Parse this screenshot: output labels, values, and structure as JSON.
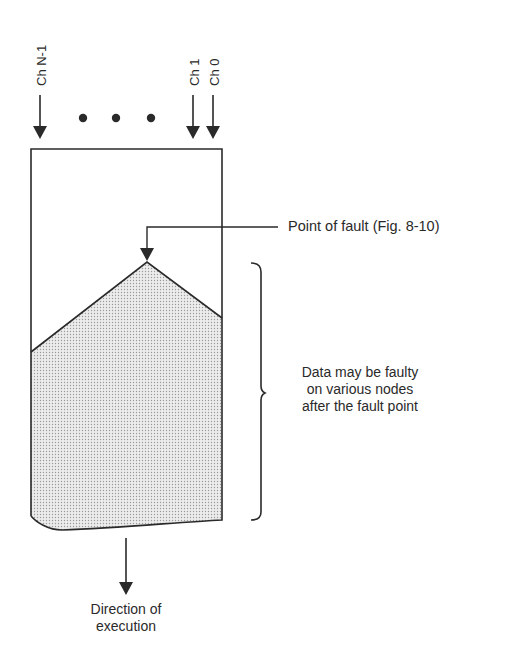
{
  "channels": {
    "left_label": "Ch N-1",
    "right_labels": [
      "Ch 1",
      "Ch 0"
    ],
    "ellipsis": "• • •"
  },
  "annotations": {
    "fault_point": "Point of fault (Fig. 8-10)",
    "faulty_data": [
      "Data may be faulty",
      "on various nodes",
      "after the fault point"
    ],
    "direction": [
      "Direction of",
      "execution"
    ]
  },
  "colors": {
    "line": "#2a2a2a",
    "shade": "#d9d9d9",
    "background": "#ffffff"
  }
}
